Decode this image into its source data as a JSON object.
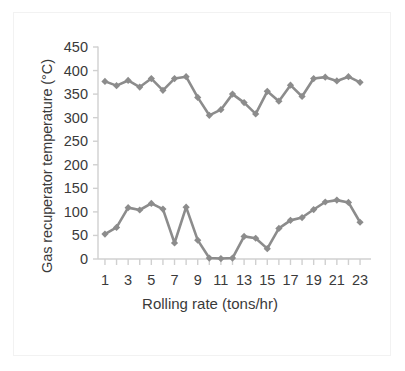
{
  "chart_data": {
    "type": "line",
    "title": "",
    "xlabel": "Rolling rate (tons/hr)",
    "ylabel": "Gas recuperator temperature (°C)",
    "xlim": [
      0.4,
      23.6
    ],
    "ylim": [
      0,
      450
    ],
    "grid": false,
    "legend": "none",
    "marker": "diamond",
    "series_color": "#8c8c8c",
    "y_ticks": [
      0,
      50,
      100,
      150,
      200,
      250,
      300,
      350,
      400,
      450
    ],
    "y_tick_labels": [
      "0",
      "50",
      "100",
      "150",
      "200",
      "250",
      "300",
      "350",
      "400",
      "450"
    ],
    "x_ticks": [
      1,
      2,
      3,
      4,
      5,
      6,
      7,
      8,
      9,
      10,
      11,
      12,
      13,
      14,
      15,
      16,
      17,
      18,
      19,
      20,
      21,
      22,
      23
    ],
    "x_tick_labels": [
      "1",
      "",
      "3",
      "",
      "5",
      "",
      "7",
      "",
      "9",
      "",
      "11",
      "",
      "13",
      "",
      "15",
      "",
      "17",
      "",
      "19",
      "",
      "21",
      "",
      "23"
    ],
    "x": [
      1,
      2,
      3,
      4,
      5,
      6,
      7,
      8,
      9,
      10,
      11,
      12,
      13,
      14,
      15,
      16,
      17,
      18,
      19,
      20,
      21,
      22,
      23
    ],
    "series": [
      {
        "name": "upper",
        "values": [
          377,
          368,
          379,
          365,
          383,
          358,
          383,
          387,
          343,
          305,
          317,
          350,
          332,
          308,
          356,
          335,
          369,
          345,
          383,
          386,
          378,
          387,
          375
        ]
      },
      {
        "name": "lower",
        "values": [
          53,
          67,
          109,
          104,
          118,
          106,
          34,
          110,
          40,
          2,
          1,
          2,
          48,
          44,
          22,
          65,
          82,
          88,
          105,
          121,
          125,
          120,
          78
        ]
      }
    ]
  },
  "axis": {
    "y_axis_title": "Gas recuperator temperature (°C)",
    "x_axis_title": "Rolling rate (tons/hr)"
  }
}
